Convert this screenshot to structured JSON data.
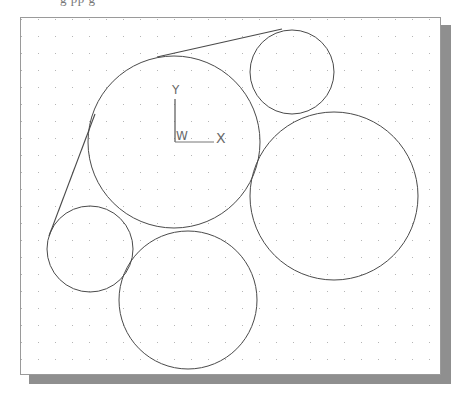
{
  "caption": {
    "fragment": "g     pp      g"
  },
  "viewport": {
    "background": "#ffffff",
    "border_color": "#9a9a9a",
    "shadow_color": "#8f8f8f",
    "grid": {
      "spacing": 17,
      "dot_color": "#b5b5b5"
    }
  },
  "ucs_icon": {
    "x_label": "X",
    "y_label": "Y",
    "w_label": "W"
  },
  "drawing": {
    "stroke": "#4a4a4a",
    "circles": [
      {
        "name": "large-center-circle",
        "cx": 174,
        "cy": 142,
        "r": 86
      },
      {
        "name": "top-right-small-circle",
        "cx": 292,
        "cy": 72,
        "r": 42
      },
      {
        "name": "right-large-circle",
        "cx": 334,
        "cy": 196,
        "r": 84
      },
      {
        "name": "left-small-circle",
        "cx": 90,
        "cy": 249,
        "r": 43
      },
      {
        "name": "bottom-circle",
        "cx": 188,
        "cy": 300,
        "r": 69
      }
    ],
    "lines": [
      {
        "name": "top-tangent-line",
        "x1": 157,
        "y1": 57,
        "x2": 282,
        "y2": 29
      },
      {
        "name": "left-tangent-line",
        "x1": 95,
        "y1": 114,
        "x2": 49,
        "y2": 236
      }
    ]
  }
}
